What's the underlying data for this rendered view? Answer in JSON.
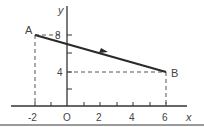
{
  "diagram": {
    "type": "coordinate-plane-vector",
    "axes": {
      "x_label": "x",
      "y_label": "y",
      "origin_label": "O"
    },
    "x_ticks": [
      "-2",
      "2",
      "4",
      "6"
    ],
    "y_ticks": [
      "4",
      "8"
    ],
    "points": [
      {
        "label": "A",
        "x": -2,
        "y": 8
      },
      {
        "label": "B",
        "x": 6,
        "y": 4
      }
    ],
    "vector": {
      "from": "A",
      "to": "B"
    },
    "colors": {
      "line": "#2a2a2a",
      "axis": "#333333",
      "dashed": "#555555",
      "bottom_bar": "#9a9a9a"
    }
  }
}
